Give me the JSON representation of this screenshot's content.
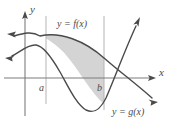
{
  "figure": {
    "type": "calculus-area-between-curves",
    "background_color": "#ffffff",
    "curve_color": "#4a4a4a",
    "axis_color": "#7d7d7d",
    "boundary_line_color": "#b4b4b4",
    "shade_color": "#d4d4d4",
    "axes": {
      "y_label": "y",
      "x_label": "x",
      "origin_px": [
        25,
        78
      ]
    },
    "bounds": {
      "lower_label": "a",
      "lower_x_px": 46,
      "upper_label": "b",
      "upper_x_px": 104
    },
    "curves": [
      {
        "id": "f",
        "label_y": "y",
        "label_eq": "=",
        "label_fn": "f(x)",
        "label_full": "y = f(x)",
        "label_pos_px": [
          57,
          24
        ]
      },
      {
        "id": "g",
        "label_y": "y",
        "label_eq": "=",
        "label_fn": "g(x)",
        "label_full": "y = g(x)",
        "label_pos_px": [
          112,
          112
        ]
      }
    ],
    "shaded_region": {
      "description": "Region between y = f(x) above and y = g(x) below, from x = a to x = b",
      "fill": "#d4d4d4"
    }
  }
}
